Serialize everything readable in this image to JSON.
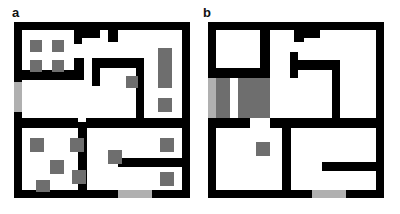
{
  "figure": {
    "width": 400,
    "height": 214,
    "background": "#ffffff",
    "type": "floor-plan-diagram"
  },
  "colors": {
    "wall": "#000000",
    "floor": "#ffffff",
    "obstacle_gray": "#6e6e6e",
    "door_gray": "#b0b0b0",
    "page_background": "#ffffff",
    "label_text": "#111111"
  },
  "panels": [
    {
      "id": "panel-a",
      "label": "a",
      "label_x": 12,
      "label_y": 6,
      "origin_x": 14,
      "origin_y": 22,
      "width": 176,
      "height": 176,
      "shapes": [
        {
          "name": "outer-wall-top",
          "kind": "wall",
          "x": 0,
          "y": 0,
          "w": 176,
          "h": 8
        },
        {
          "name": "outer-wall-bottom",
          "kind": "wall",
          "x": 0,
          "y": 168,
          "w": 176,
          "h": 8
        },
        {
          "name": "outer-wall-left",
          "kind": "wall",
          "x": 0,
          "y": 0,
          "w": 8,
          "h": 176
        },
        {
          "name": "outer-wall-right",
          "kind": "wall",
          "x": 168,
          "y": 0,
          "w": 8,
          "h": 176
        },
        {
          "name": "door-left-exterior",
          "kind": "door",
          "x": 0,
          "y": 60,
          "w": 8,
          "h": 30
        },
        {
          "name": "door-bottom-exterior",
          "kind": "door",
          "x": 104,
          "y": 168,
          "w": 34,
          "h": 8
        },
        {
          "name": "wall-room1-right-upper",
          "kind": "wall",
          "x": 60,
          "y": 8,
          "w": 8,
          "h": 14
        },
        {
          "name": "wall-top-notch-a",
          "kind": "wall",
          "x": 68,
          "y": 8,
          "w": 18,
          "h": 8
        },
        {
          "name": "wall-top-notch-b",
          "kind": "wall",
          "x": 94,
          "y": 8,
          "w": 10,
          "h": 12
        },
        {
          "name": "wall-room1-bottom",
          "kind": "wall",
          "x": 8,
          "y": 48,
          "w": 62,
          "h": 10
        },
        {
          "name": "wall-room1-right-lower",
          "kind": "wall",
          "x": 60,
          "y": 36,
          "w": 10,
          "h": 14
        },
        {
          "name": "wall-mid-corridor-top",
          "kind": "wall",
          "x": 78,
          "y": 36,
          "w": 8,
          "h": 28
        },
        {
          "name": "wall-mid-corridor-h",
          "kind": "wall",
          "x": 86,
          "y": 36,
          "w": 44,
          "h": 10
        },
        {
          "name": "wall-mid-corridor-v",
          "kind": "wall",
          "x": 122,
          "y": 44,
          "w": 8,
          "h": 56
        },
        {
          "name": "wall-mid-corner-block",
          "kind": "obstacle",
          "x": 112,
          "y": 54,
          "w": 12,
          "h": 12
        },
        {
          "name": "wall-center-divider",
          "kind": "wall",
          "x": 8,
          "y": 96,
          "w": 56,
          "h": 10
        },
        {
          "name": "wall-center-divider-2",
          "kind": "wall",
          "x": 72,
          "y": 96,
          "w": 50,
          "h": 10
        },
        {
          "name": "wall-center-divider-3",
          "kind": "wall",
          "x": 122,
          "y": 96,
          "w": 46,
          "h": 10
        },
        {
          "name": "wall-room3-left-v",
          "kind": "wall",
          "x": 64,
          "y": 100,
          "w": 9,
          "h": 68
        },
        {
          "name": "wall-room4-shelf",
          "kind": "wall",
          "x": 104,
          "y": 136,
          "w": 64,
          "h": 9
        },
        {
          "name": "obstacle-r1-a",
          "kind": "obstacle",
          "x": 16,
          "y": 18,
          "w": 12,
          "h": 12
        },
        {
          "name": "obstacle-r1-b",
          "kind": "obstacle",
          "x": 38,
          "y": 18,
          "w": 12,
          "h": 12
        },
        {
          "name": "obstacle-r1-c",
          "kind": "obstacle",
          "x": 16,
          "y": 38,
          "w": 12,
          "h": 12
        },
        {
          "name": "obstacle-r1-d",
          "kind": "obstacle",
          "x": 38,
          "y": 38,
          "w": 12,
          "h": 12
        },
        {
          "name": "obstacle-right-tall",
          "kind": "obstacle",
          "x": 144,
          "y": 26,
          "w": 14,
          "h": 40
        },
        {
          "name": "obstacle-right-mid",
          "kind": "obstacle",
          "x": 144,
          "y": 76,
          "w": 14,
          "h": 14
        },
        {
          "name": "obstacle-r3-a",
          "kind": "obstacle",
          "x": 16,
          "y": 116,
          "w": 14,
          "h": 14
        },
        {
          "name": "obstacle-r3-b",
          "kind": "obstacle",
          "x": 36,
          "y": 138,
          "w": 14,
          "h": 14
        },
        {
          "name": "obstacle-r3-c",
          "kind": "obstacle",
          "x": 22,
          "y": 158,
          "w": 14,
          "h": 12
        },
        {
          "name": "obstacle-r3-d",
          "kind": "obstacle",
          "x": 56,
          "y": 116,
          "w": 14,
          "h": 14
        },
        {
          "name": "obstacle-r3-e",
          "kind": "obstacle",
          "x": 58,
          "y": 148,
          "w": 14,
          "h": 14
        },
        {
          "name": "obstacle-r4-a",
          "kind": "obstacle",
          "x": 94,
          "y": 128,
          "w": 14,
          "h": 14
        },
        {
          "name": "obstacle-r4-b",
          "kind": "obstacle",
          "x": 146,
          "y": 116,
          "w": 14,
          "h": 14
        },
        {
          "name": "obstacle-r4-c",
          "kind": "obstacle",
          "x": 146,
          "y": 150,
          "w": 14,
          "h": 14
        }
      ]
    },
    {
      "id": "panel-b",
      "label": "b",
      "label_x": 203,
      "label_y": 6,
      "origin_x": 208,
      "origin_y": 22,
      "width": 176,
      "height": 176,
      "shapes": [
        {
          "name": "outer-wall-top",
          "kind": "wall",
          "x": 0,
          "y": 0,
          "w": 176,
          "h": 8
        },
        {
          "name": "outer-wall-bottom",
          "kind": "wall",
          "x": 0,
          "y": 168,
          "w": 176,
          "h": 8
        },
        {
          "name": "outer-wall-left",
          "kind": "wall",
          "x": 0,
          "y": 0,
          "w": 8,
          "h": 176
        },
        {
          "name": "outer-wall-right",
          "kind": "wall",
          "x": 168,
          "y": 0,
          "w": 8,
          "h": 176
        },
        {
          "name": "door-left-exterior",
          "kind": "door",
          "x": 0,
          "y": 56,
          "w": 8,
          "h": 40
        },
        {
          "name": "door-bottom-exterior",
          "kind": "door",
          "x": 104,
          "y": 168,
          "w": 34,
          "h": 8
        },
        {
          "name": "wall-top-notch-a",
          "kind": "wall",
          "x": 52,
          "y": 8,
          "w": 10,
          "h": 12
        },
        {
          "name": "wall-top-notch-b",
          "kind": "wall",
          "x": 86,
          "y": 8,
          "w": 10,
          "h": 12
        },
        {
          "name": "wall-top-notch-c",
          "kind": "wall",
          "x": 96,
          "y": 8,
          "w": 16,
          "h": 8
        },
        {
          "name": "wall-room1-bottom",
          "kind": "wall",
          "x": 0,
          "y": 46,
          "w": 62,
          "h": 10
        },
        {
          "name": "wall-room1-right-v",
          "kind": "wall",
          "x": 52,
          "y": 20,
          "w": 10,
          "h": 30
        },
        {
          "name": "wall-mid-corridor-v1",
          "kind": "wall",
          "x": 82,
          "y": 30,
          "w": 8,
          "h": 26
        },
        {
          "name": "wall-mid-corridor-h",
          "kind": "wall",
          "x": 88,
          "y": 38,
          "w": 44,
          "h": 10
        },
        {
          "name": "wall-mid-corridor-v2",
          "kind": "wall",
          "x": 124,
          "y": 46,
          "w": 8,
          "h": 58
        },
        {
          "name": "wall-center-divider",
          "kind": "wall",
          "x": 0,
          "y": 96,
          "w": 42,
          "h": 10
        },
        {
          "name": "wall-center-divider-2",
          "kind": "wall",
          "x": 62,
          "y": 96,
          "w": 70,
          "h": 10
        },
        {
          "name": "wall-center-divider-3",
          "kind": "wall",
          "x": 112,
          "y": 96,
          "w": 58,
          "h": 10
        },
        {
          "name": "wall-room3-right-v",
          "kind": "wall",
          "x": 74,
          "y": 100,
          "w": 9,
          "h": 68
        },
        {
          "name": "wall-room4-shelf",
          "kind": "wall",
          "x": 114,
          "y": 140,
          "w": 54,
          "h": 9
        },
        {
          "name": "gray-region-left",
          "kind": "obstacle",
          "x": 8,
          "y": 56,
          "w": 14,
          "h": 40
        },
        {
          "name": "gray-region-mid",
          "kind": "obstacle",
          "x": 30,
          "y": 56,
          "w": 22,
          "h": 40
        },
        {
          "name": "gray-region-upper",
          "kind": "obstacle",
          "x": 30,
          "y": 56,
          "w": 32,
          "h": 8
        },
        {
          "name": "gray-region-right",
          "kind": "obstacle",
          "x": 52,
          "y": 64,
          "w": 10,
          "h": 32
        },
        {
          "name": "obstacle-center-single",
          "kind": "obstacle",
          "x": 48,
          "y": 120,
          "w": 14,
          "h": 14
        }
      ]
    }
  ]
}
